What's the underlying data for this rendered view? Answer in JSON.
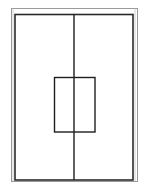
{
  "diagram": {
    "title": "",
    "colors": {
      "background": "#ffffff",
      "frame_outer": "#9a9a9a",
      "frame_inner": "#2a2a2a",
      "lines": "#1e1e1e"
    },
    "outer_frame": {
      "x": 11,
      "y": 8,
      "width": 126,
      "height": 173
    },
    "inner_frame": {
      "x": 15,
      "y": 14,
      "width": 118,
      "height": 166
    },
    "center_split": {
      "x": 74,
      "y1": 14,
      "y2": 180
    },
    "center_panel": {
      "x": 54,
      "y": 77,
      "width": 41,
      "height": 55
    }
  }
}
